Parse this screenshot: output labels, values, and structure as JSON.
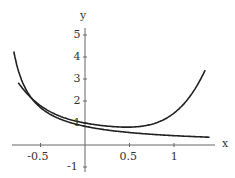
{
  "chart_data": {
    "type": "line",
    "title": "",
    "xlabel": "x",
    "ylabel": "y",
    "xlim": [
      -0.8,
      1.4
    ],
    "ylim": [
      -1.3,
      5.5
    ],
    "x_ticks": [
      "-0.5",
      "0.5",
      "1"
    ],
    "y_ticks": [
      "5",
      "4",
      "3",
      "2",
      "1",
      "-1"
    ],
    "grid": false,
    "legend": [],
    "series": [
      {
        "name": "f(x) = 1/(1+x) approx (decaying curve)",
        "x": [
          -0.8,
          -0.5,
          0,
          0.5,
          1,
          1.4
        ],
        "y": [
          5.0,
          2.0,
          1.0,
          0.67,
          0.5,
          0.42
        ]
      },
      {
        "name": "approximating curve (U-shaped)",
        "x": [
          -0.8,
          -0.5,
          0,
          0.5,
          0.7,
          1,
          1.4
        ],
        "y": [
          3.4,
          1.9,
          1.0,
          0.7,
          0.65,
          1.1,
          2.6
        ]
      }
    ]
  },
  "axes": {
    "x_label": "x",
    "y_label": "y"
  }
}
